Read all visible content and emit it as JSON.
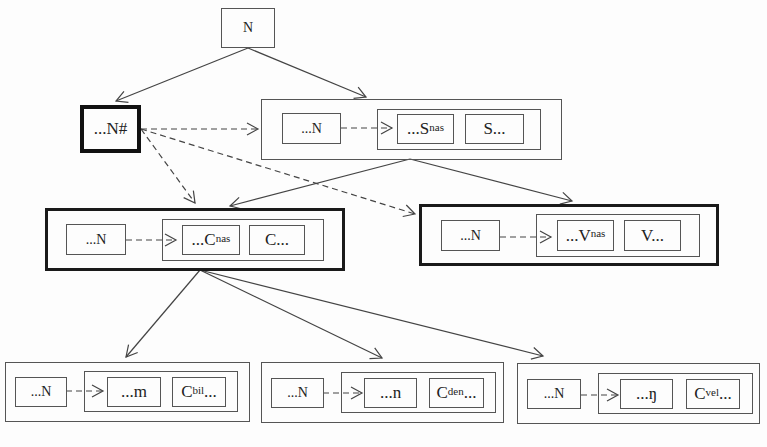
{
  "diagram": {
    "root": {
      "label": "N"
    },
    "word_final": {
      "label": "...N#"
    },
    "nodes": {
      "sonorant": {
        "left": "...N",
        "mid_base": "...S",
        "mid_sup": "nas",
        "right": "S..."
      },
      "consonant": {
        "left": "...N",
        "mid_base": "...C",
        "mid_sup": "nas",
        "right": "C..."
      },
      "vowel": {
        "left": "...N",
        "mid_base": "...V",
        "mid_sup": "nas",
        "right": "V..."
      },
      "bilabial": {
        "left": "...N",
        "mid": "...m",
        "right_base": "C",
        "right_sup": "bil",
        "right_tail": "..."
      },
      "dental": {
        "left": "...N",
        "mid": "...n",
        "right_base": "C",
        "right_sup": "den",
        "right_tail": "..."
      },
      "velar": {
        "left": "...N",
        "mid": "...ŋ",
        "right_base": "C",
        "right_sup": "vel",
        "right_tail": "..."
      }
    },
    "edge_types": {
      "solid": "hierarchy",
      "dashed": "inheritance"
    }
  }
}
